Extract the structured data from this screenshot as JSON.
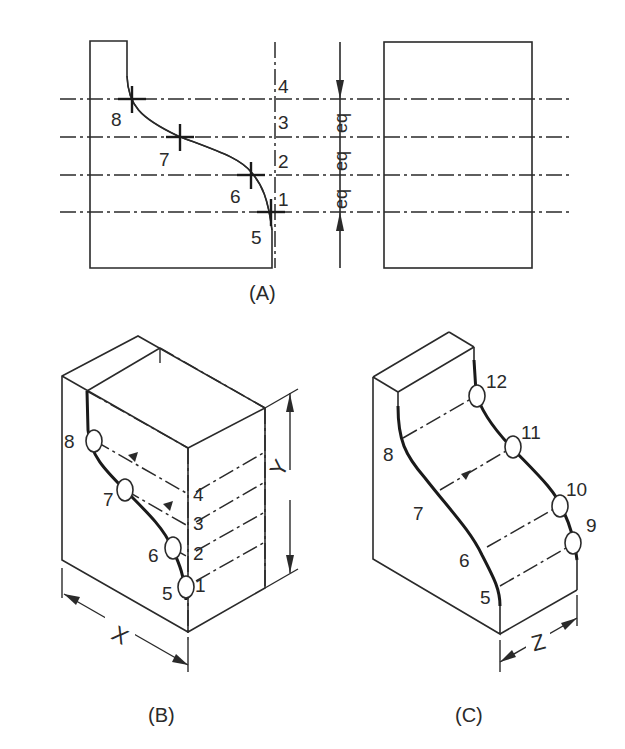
{
  "figure": {
    "view_a": {
      "caption": "(A)",
      "curve_points": [
        "8",
        "7",
        "6",
        "5"
      ],
      "height_marks": [
        "4",
        "3",
        "2",
        "1"
      ],
      "equal_spacing_labels": [
        "eq",
        "eq",
        "eq"
      ]
    },
    "view_b": {
      "caption": "(B)",
      "curve_points": [
        "8",
        "7",
        "6",
        "5"
      ],
      "height_marks": [
        "4",
        "3",
        "2",
        "1"
      ],
      "dimensions": {
        "width": "X",
        "height": "Y"
      }
    },
    "view_c": {
      "caption": "(C)",
      "front_curve_points": [
        "8",
        "7",
        "6",
        "5"
      ],
      "back_curve_points": [
        "12",
        "11",
        "10",
        "9"
      ],
      "dimensions": {
        "depth": "Z"
      }
    }
  }
}
